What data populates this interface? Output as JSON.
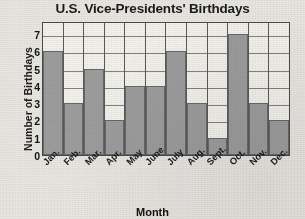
{
  "chart_data": {
    "type": "bar",
    "title": "U.S. Vice-Presidents' Birthdays",
    "xlabel": "Month",
    "ylabel": "Number of Birthdays",
    "categories": [
      "Jan.",
      "Feb.",
      "Mar.",
      "Apr.",
      "May",
      "June",
      "July",
      "Aug.",
      "Sept.",
      "Oct.",
      "Nov.",
      "Dec."
    ],
    "values": [
      6,
      3,
      5,
      2,
      4,
      4,
      6,
      3,
      1,
      7,
      3,
      2
    ],
    "ytick_labels": [
      "0",
      "1",
      "2",
      "3",
      "4",
      "5",
      "6",
      "7"
    ],
    "yticks": [
      0,
      1,
      2,
      3,
      4,
      5,
      6,
      7
    ],
    "ylim": [
      0,
      7.75
    ],
    "grid": "horizontal",
    "legend": "none",
    "bar_color": "#9d9d9d",
    "axis_color": "#4a4a4a",
    "background_color": "#f3f1ec"
  }
}
